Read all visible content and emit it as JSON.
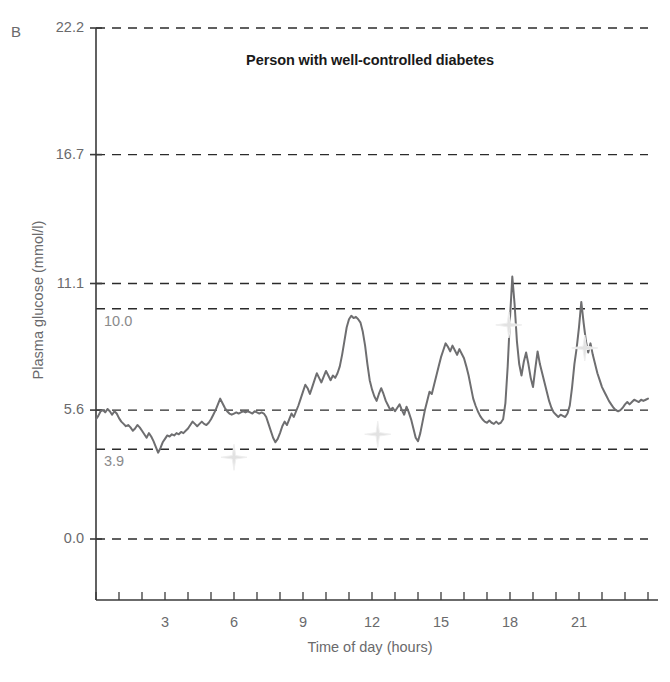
{
  "panel": {
    "label": "B"
  },
  "caption": {
    "text": ""
  },
  "chart_data": {
    "type": "line",
    "title": "Person with well-controlled diabetes",
    "xlabel": "Time of day (hours)",
    "ylabel": "Plasma glucose (mmol/l)",
    "xlim": [
      0,
      24
    ],
    "ylim": [
      0,
      22.2
    ],
    "grid": true,
    "legend_position": "none",
    "y_ticks": [
      {
        "value": 22.2,
        "label": "22.2"
      },
      {
        "value": 16.7,
        "label": "16.7"
      },
      {
        "value": 11.1,
        "label": "11.1"
      },
      {
        "value": 5.6,
        "label": "5.6"
      },
      {
        "value": 0.0,
        "label": "0.0"
      }
    ],
    "threshold_lines": [
      {
        "value": 10.0,
        "label": "10.0",
        "style": "dashed"
      },
      {
        "value": 3.9,
        "label": "3.9",
        "style": "dashed"
      }
    ],
    "x_ticks_major": [
      {
        "value": 3,
        "label": "3"
      },
      {
        "value": 6,
        "label": "6"
      },
      {
        "value": 9,
        "label": "9"
      },
      {
        "value": 12,
        "label": "12"
      },
      {
        "value": 15,
        "label": "15"
      },
      {
        "value": 18,
        "label": "18"
      },
      {
        "value": 21,
        "label": "21"
      }
    ],
    "x_ticks_minor_interval": 1,
    "series": [
      {
        "name": "Continuous glucose trace",
        "color": "#6e6e70",
        "x": [
          0.0,
          0.1,
          0.2,
          0.3,
          0.4,
          0.5,
          0.6,
          0.7,
          0.8,
          0.9,
          1.0,
          1.1,
          1.2,
          1.3,
          1.4,
          1.5,
          1.6,
          1.7,
          1.8,
          1.9,
          2.0,
          2.1,
          2.2,
          2.3,
          2.4,
          2.5,
          2.6,
          2.7,
          2.8,
          2.9,
          3.0,
          3.1,
          3.2,
          3.3,
          3.4,
          3.5,
          3.6,
          3.7,
          3.8,
          3.9,
          4.0,
          4.1,
          4.2,
          4.3,
          4.4,
          4.5,
          4.6,
          4.7,
          4.8,
          4.9,
          5.0,
          5.1,
          5.2,
          5.3,
          5.4,
          5.5,
          5.6,
          5.7,
          5.8,
          5.9,
          6.0,
          6.1,
          6.2,
          6.3,
          6.4,
          6.5,
          6.6,
          6.7,
          6.8,
          6.9,
          7.0,
          7.1,
          7.2,
          7.3,
          7.4,
          7.5,
          7.6,
          7.7,
          7.8,
          7.9,
          8.0,
          8.1,
          8.2,
          8.3,
          8.4,
          8.5,
          8.6,
          8.7,
          8.8,
          8.9,
          9.0,
          9.1,
          9.2,
          9.3,
          9.4,
          9.5,
          9.6,
          9.7,
          9.8,
          9.9,
          10.0,
          10.1,
          10.2,
          10.3,
          10.4,
          10.5,
          10.6,
          10.7,
          10.8,
          10.9,
          11.0,
          11.1,
          11.2,
          11.3,
          11.4,
          11.5,
          11.6,
          11.7,
          11.8,
          11.9,
          12.0,
          12.1,
          12.2,
          12.3,
          12.4,
          12.5,
          12.6,
          12.7,
          12.8,
          12.9,
          13.0,
          13.1,
          13.2,
          13.3,
          13.4,
          13.5,
          13.6,
          13.7,
          13.8,
          13.9,
          14.0,
          14.1,
          14.2,
          14.3,
          14.4,
          14.5,
          14.6,
          14.7,
          14.8,
          14.9,
          15.0,
          15.1,
          15.2,
          15.3,
          15.4,
          15.5,
          15.6,
          15.7,
          15.8,
          15.9,
          16.0,
          16.1,
          16.2,
          16.3,
          16.4,
          16.5,
          16.6,
          16.7,
          16.8,
          16.9,
          17.0,
          17.1,
          17.2,
          17.3,
          17.4,
          17.5,
          17.6,
          17.7,
          17.8,
          17.9,
          18.0,
          18.1,
          18.2,
          18.3,
          18.4,
          18.5,
          18.6,
          18.7,
          18.8,
          18.9,
          19.0,
          19.1,
          19.2,
          19.3,
          19.4,
          19.5,
          19.6,
          19.7,
          19.8,
          19.9,
          20.0,
          20.1,
          20.2,
          20.3,
          20.4,
          20.5,
          20.6,
          20.7,
          20.8,
          20.9,
          21.0,
          21.1,
          21.2,
          21.3,
          21.4,
          21.5,
          21.6,
          21.7,
          21.8,
          21.9,
          22.0,
          22.1,
          22.2,
          22.3,
          22.4,
          22.5,
          22.6,
          22.7,
          22.8,
          22.9,
          23.0,
          23.1,
          23.2,
          23.3,
          23.4,
          23.5,
          23.6,
          23.7,
          23.8,
          23.9,
          24.0
        ],
        "y": [
          5.2,
          5.35,
          5.55,
          5.6,
          5.5,
          5.65,
          5.55,
          5.4,
          5.55,
          5.45,
          5.25,
          5.1,
          5.0,
          4.9,
          4.95,
          4.85,
          4.7,
          4.8,
          4.95,
          4.85,
          4.7,
          4.55,
          4.4,
          4.6,
          4.45,
          4.25,
          4.0,
          3.75,
          3.95,
          4.2,
          4.35,
          4.5,
          4.45,
          4.55,
          4.5,
          4.6,
          4.55,
          4.65,
          4.6,
          4.7,
          4.8,
          4.95,
          5.1,
          5.0,
          4.9,
          5.0,
          5.1,
          5.0,
          4.95,
          5.05,
          5.2,
          5.4,
          5.6,
          5.85,
          6.1,
          5.9,
          5.7,
          5.55,
          5.45,
          5.4,
          5.45,
          5.5,
          5.45,
          5.5,
          5.55,
          5.5,
          5.55,
          5.5,
          5.45,
          5.55,
          5.5,
          5.45,
          5.5,
          5.45,
          5.3,
          5.0,
          4.7,
          4.4,
          4.2,
          4.35,
          4.6,
          4.9,
          5.1,
          4.95,
          5.2,
          5.45,
          5.3,
          5.55,
          5.8,
          6.1,
          6.4,
          6.7,
          6.55,
          6.3,
          6.6,
          6.9,
          7.2,
          7.0,
          6.8,
          7.05,
          7.3,
          7.1,
          6.9,
          7.1,
          7.0,
          7.2,
          7.5,
          8.0,
          8.6,
          9.2,
          9.55,
          9.7,
          9.6,
          9.65,
          9.55,
          9.4,
          9.0,
          8.4,
          7.6,
          6.9,
          6.5,
          6.2,
          6.0,
          6.3,
          6.55,
          6.3,
          6.0,
          5.8,
          5.6,
          5.7,
          5.55,
          5.7,
          5.85,
          5.6,
          5.4,
          5.75,
          5.5,
          5.2,
          4.8,
          4.4,
          4.25,
          4.6,
          5.1,
          5.6,
          6.0,
          6.4,
          6.3,
          6.7,
          7.1,
          7.5,
          7.9,
          8.2,
          8.5,
          8.35,
          8.15,
          8.4,
          8.2,
          8.0,
          8.25,
          8.05,
          7.85,
          7.5,
          7.1,
          6.6,
          6.1,
          5.8,
          5.55,
          5.35,
          5.2,
          5.1,
          5.05,
          5.15,
          5.05,
          5.0,
          5.1,
          5.0,
          5.05,
          5.2,
          5.9,
          7.5,
          9.6,
          11.4,
          10.2,
          8.6,
          7.6,
          7.1,
          7.7,
          8.1,
          7.6,
          7.0,
          6.6,
          7.4,
          8.15,
          7.6,
          7.2,
          6.8,
          6.4,
          6.0,
          5.7,
          5.5,
          5.4,
          5.3,
          5.4,
          5.35,
          5.3,
          5.45,
          5.8,
          6.6,
          7.6,
          8.3,
          9.2,
          10.3,
          9.4,
          8.6,
          8.1,
          8.5,
          8.0,
          7.6,
          7.2,
          6.9,
          6.6,
          6.4,
          6.2,
          6.0,
          5.85,
          5.7,
          5.6,
          5.55,
          5.6,
          5.7,
          5.85,
          5.95,
          5.85,
          5.95,
          6.05,
          6.0,
          5.95,
          6.05,
          6.0,
          6.05,
          6.1
        ]
      }
    ],
    "event_markers": [
      {
        "name": "star-marker-1",
        "x": 6.0,
        "y": 3.55
      },
      {
        "name": "star-marker-2",
        "x": 12.25,
        "y": 4.55
      },
      {
        "name": "star-marker-3",
        "x": 17.95,
        "y": 9.3
      },
      {
        "name": "star-marker-4",
        "x": 21.25,
        "y": 8.3
      }
    ]
  }
}
